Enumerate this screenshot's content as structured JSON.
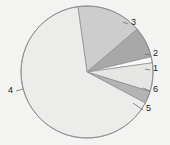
{
  "background_color": "#f3f3f1",
  "chart_data": {
    "type": "pie",
    "title": "",
    "subtitle": "",
    "xlabel": "",
    "ylabel": "",
    "legend_position": "none",
    "grid": false,
    "center": {
      "x": 87,
      "y": 72
    },
    "radius": 66,
    "start_angle_deg": -98,
    "direction": "clockwise",
    "categories": [
      "1",
      "2",
      "3",
      "4",
      "5",
      "6"
    ],
    "values": [
      1.5,
      7.5,
      16,
      65,
      3,
      7
    ],
    "labels": [
      "1",
      "2",
      "3",
      "4",
      "5",
      "6"
    ],
    "outline_color": "#8a8a8a",
    "slices": [
      {
        "label": "3",
        "value": 16,
        "color": "#cdcdcd",
        "label_x": 131,
        "label_y": 25,
        "leader": {
          "x1": 123,
          "y1": 22,
          "x2": 128,
          "y2": 24
        }
      },
      {
        "label": "2",
        "value": 7.5,
        "color": "#a8a8a8",
        "label_x": 153,
        "label_y": 56,
        "leader": {
          "x1": 145,
          "y1": 54,
          "x2": 150,
          "y2": 55
        }
      },
      {
        "label": "1",
        "value": 1.5,
        "color": "#fbfbfa",
        "label_x": 153,
        "label_y": 71,
        "leader": {
          "x1": 145,
          "y1": 69,
          "x2": 150,
          "y2": 70
        }
      },
      {
        "label": "6",
        "value": 7,
        "color": "#e6e6e4",
        "label_x": 153,
        "label_y": 92,
        "leader": {
          "x1": 143,
          "y1": 88,
          "x2": 150,
          "y2": 91
        }
      },
      {
        "label": "5",
        "value": 3,
        "color": "#b4b4b4",
        "label_x": 146,
        "label_y": 111,
        "leader": {
          "x1": 133,
          "y1": 103,
          "x2": 143,
          "y2": 110
        }
      },
      {
        "label": "4",
        "value": 65,
        "color": "#ececea",
        "label_x": 8,
        "label_y": 93,
        "leader": {
          "x1": 16,
          "y1": 91,
          "x2": 23,
          "y2": 89
        }
      }
    ]
  }
}
